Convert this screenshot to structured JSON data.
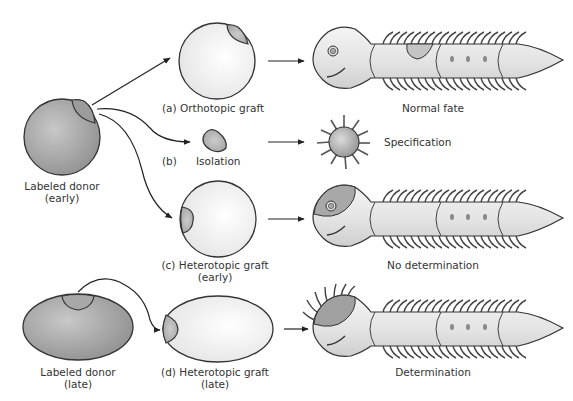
{
  "diagram": {
    "colors": {
      "outline": "#333333",
      "donor_fill": "#a9a9a9",
      "host_fill": "#f2f2f2",
      "graft_patch": "#b8b8b8",
      "text": "#333333"
    },
    "donors": {
      "early": {
        "line1": "Labeled donor",
        "line2": "(early)"
      },
      "late": {
        "line1": "Labeled donor",
        "line2": "(late)"
      }
    },
    "experiments": [
      {
        "id": "a",
        "label": "(a)  Orthotopic graft",
        "outcome": "Normal fate"
      },
      {
        "id": "b",
        "label_letter": "(b)",
        "label": "Isolation",
        "outcome": "Specification"
      },
      {
        "id": "c",
        "label": "(c) Heterotopic graft",
        "label2": "(early)",
        "outcome": "No determination"
      },
      {
        "id": "d",
        "label": "(d) Heterotopic graft",
        "label2": "(late)",
        "outcome": "Determination"
      }
    ]
  }
}
